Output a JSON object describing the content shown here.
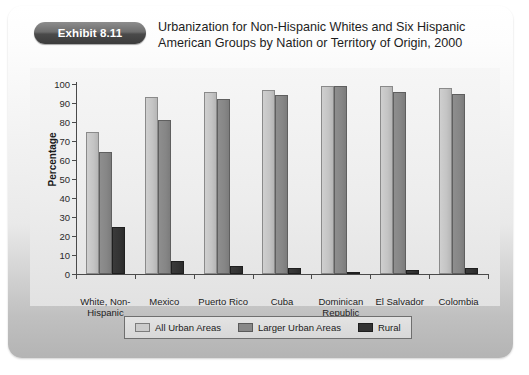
{
  "exhibit": {
    "badge_label": "Exhibit 8.11",
    "title": "Urbanization for Non-Hispanic Whites and Six Hispanic American Groups by Nation or Territory of Origin, 2000"
  },
  "chart_data": {
    "type": "bar",
    "title": "Urbanization for Non-Hispanic Whites and Six Hispanic American Groups by Nation or Territory of Origin, 2000",
    "xlabel": "",
    "ylabel": "Percentage",
    "ylim": [
      0,
      100
    ],
    "ytick_step": 10,
    "yticks": [
      0,
      10,
      20,
      30,
      40,
      50,
      60,
      70,
      80,
      90,
      100
    ],
    "grid": false,
    "legend_position": "bottom",
    "categories": [
      "White, Non-\nHispanic",
      "Mexico",
      "Puerto Rico",
      "Cuba",
      "Dominican\nRepublic",
      "El Salvador",
      "Colombia"
    ],
    "series": [
      {
        "name": "All Urban Areas",
        "color": "#c6c6c6",
        "values": [
          75,
          93,
          96,
          97,
          99,
          99,
          98
        ]
      },
      {
        "name": "Larger Urban Areas",
        "color": "#868686",
        "values": [
          64,
          81,
          92,
          94,
          99,
          96,
          95
        ]
      },
      {
        "name": "Rural",
        "color": "#333333",
        "values": [
          25,
          7,
          4,
          3,
          1,
          2,
          3
        ]
      }
    ]
  }
}
